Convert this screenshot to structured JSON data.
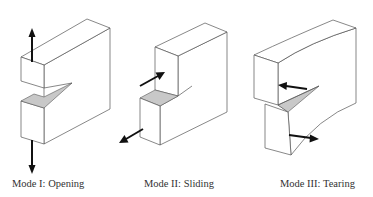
{
  "figure": {
    "panels": [
      {
        "id": "mode-1",
        "label": "Mode I: Opening"
      },
      {
        "id": "mode-2",
        "label": "Mode II: Sliding"
      },
      {
        "id": "mode-3",
        "label": "Mode III: Tearing"
      }
    ],
    "colors": {
      "outline": "#555555",
      "crack_fill": "#c8c8c8",
      "arrow": "#111111",
      "background": "#ffffff"
    }
  }
}
